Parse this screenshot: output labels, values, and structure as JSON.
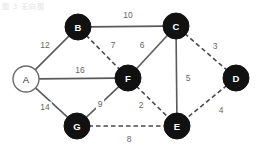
{
  "figure": {
    "title": "",
    "corner_artifact_text": "图 3 无向图",
    "background_color": "#ffffff"
  },
  "chart_data": {
    "type": "diagram",
    "diagram_kind": "weighted-undirected-graph",
    "title": "",
    "nodes": [
      {
        "id": "A",
        "label": "A",
        "x": 26,
        "y": 79,
        "r": 13,
        "style": "open",
        "fill": "#ffffff",
        "text_color": "#333333"
      },
      {
        "id": "B",
        "label": "B",
        "x": 78,
        "y": 27,
        "r": 13,
        "style": "filled",
        "fill": "#111111",
        "text_color": "#ffffff"
      },
      {
        "id": "C",
        "label": "C",
        "x": 176,
        "y": 26,
        "r": 13,
        "style": "filled",
        "fill": "#111111",
        "text_color": "#ffffff"
      },
      {
        "id": "D",
        "label": "D",
        "x": 236,
        "y": 78,
        "r": 13,
        "style": "filled",
        "fill": "#111111",
        "text_color": "#ffffff"
      },
      {
        "id": "E",
        "label": "E",
        "x": 177,
        "y": 126,
        "r": 13,
        "style": "filled",
        "fill": "#111111",
        "text_color": "#ffffff"
      },
      {
        "id": "F",
        "label": "F",
        "x": 128,
        "y": 78,
        "r": 13,
        "style": "filled",
        "fill": "#111111",
        "text_color": "#ffffff"
      },
      {
        "id": "G",
        "label": "G",
        "x": 77,
        "y": 126,
        "r": 13,
        "style": "filled",
        "fill": "#111111",
        "text_color": "#ffffff"
      }
    ],
    "edges": [
      {
        "id": "A-B",
        "source": "A",
        "target": "B",
        "weight": 12,
        "line": "solid",
        "label_x": 45,
        "label_y": 45
      },
      {
        "id": "B-C",
        "source": "B",
        "target": "C",
        "weight": 10,
        "line": "solid",
        "label_x": 128,
        "label_y": 15
      },
      {
        "id": "B-F",
        "source": "B",
        "target": "F",
        "weight": 7,
        "line": "dashed",
        "label_x": 113,
        "label_y": 45
      },
      {
        "id": "C-F",
        "source": "C",
        "target": "F",
        "weight": 6,
        "line": "solid",
        "label_x": 142,
        "label_y": 45
      },
      {
        "id": "C-D",
        "source": "C",
        "target": "D",
        "weight": 3,
        "line": "dashed",
        "label_x": 215,
        "label_y": 46
      },
      {
        "id": "C-E",
        "source": "C",
        "target": "E",
        "weight": 5,
        "line": "solid",
        "label_x": 188,
        "label_y": 78
      },
      {
        "id": "A-F",
        "source": "A",
        "target": "F",
        "weight": 16,
        "line": "solid",
        "label_x": 80,
        "label_y": 70
      },
      {
        "id": "A-G",
        "source": "A",
        "target": "G",
        "weight": 14,
        "line": "solid",
        "label_x": 45,
        "label_y": 107
      },
      {
        "id": "G-F",
        "source": "G",
        "target": "F",
        "weight": 9,
        "line": "solid",
        "label_x": 100,
        "label_y": 104
      },
      {
        "id": "F-E",
        "source": "F",
        "target": "E",
        "weight": 2,
        "line": "dashed",
        "label_x": 141,
        "label_y": 105
      },
      {
        "id": "D-E",
        "source": "D",
        "target": "E",
        "weight": 4,
        "line": "dashed",
        "label_x": 221,
        "label_y": 110
      },
      {
        "id": "G-E",
        "source": "G",
        "target": "E",
        "weight": 8,
        "line": "dashed",
        "label_x": 129,
        "label_y": 139
      }
    ],
    "legend": [],
    "colors": {
      "node_filled": "#111111",
      "node_open_fill": "#ffffff",
      "node_open_stroke": "#6b6b6b",
      "edge_solid": "#5a5a5a",
      "edge_dashed": "#4a4a4a",
      "weight_text": "#666666"
    }
  }
}
